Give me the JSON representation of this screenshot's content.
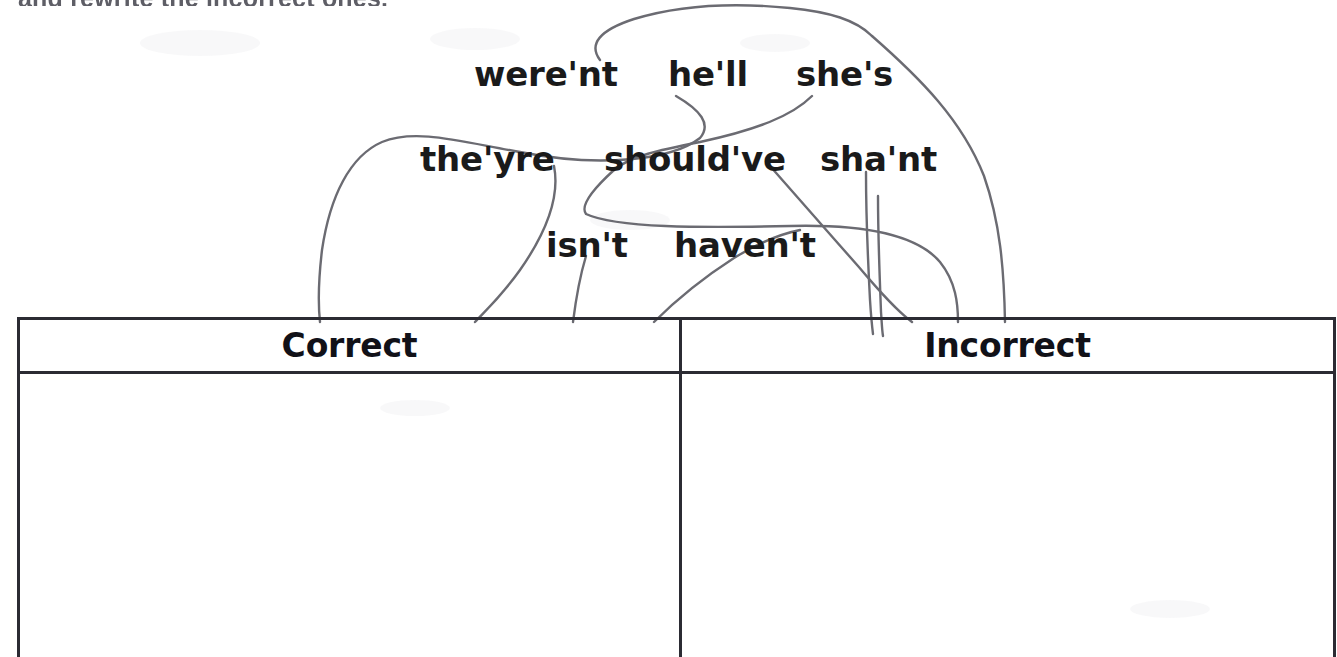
{
  "worksheet": {
    "instruction": "and rewrite the incorrect ones."
  },
  "word_bank": {
    "words": [
      {
        "text": "were'nt",
        "x": 474,
        "y": 57
      },
      {
        "text": "he'll",
        "x": 668,
        "y": 57
      },
      {
        "text": "she's",
        "x": 796,
        "y": 57
      },
      {
        "text": "the'yre",
        "x": 420,
        "y": 142
      },
      {
        "text": "should've",
        "x": 604,
        "y": 142
      },
      {
        "text": "sha'nt",
        "x": 820,
        "y": 142
      },
      {
        "text": "isn't",
        "x": 546,
        "y": 228
      },
      {
        "text": "haven't",
        "x": 674,
        "y": 228
      }
    ]
  },
  "table": {
    "columns": [
      {
        "header": "Correct",
        "cells": []
      },
      {
        "header": "Incorrect",
        "cells": []
      }
    ]
  },
  "colors": {
    "ink": "#1a1a1a",
    "rule": "#2b2b33",
    "pencil": "#6b6b72",
    "paper": "#ffffff"
  },
  "annotations": {
    "pencil_lines": [
      {
        "name": "line-werent-to-correct",
        "d": "M 600 60 C 588 44, 600 30, 634 19 C 680 5, 730 2, 790 8 C 830 12, 856 20, 872 36"
      },
      {
        "name": "line-shes-to-incorrect",
        "d": "M 872 36 C 920 78, 962 120, 984 176 C 1000 222, 1004 268, 1005 322"
      },
      {
        "name": "line-hell-loop-correct",
        "d": "M 676 96 C 700 110, 712 124, 700 138 C 672 160, 600 168, 520 152 C 462 142, 416 128, 382 142 C 350 156, 330 196, 322 250 C 318 284, 318 304, 320 322"
      },
      {
        "name": "line-shes-down-left",
        "d": "M 812 96 C 792 116, 756 130, 700 142 C 660 150, 630 156, 614 170"
      },
      {
        "name": "line-theyre-to-correct",
        "d": "M 554 166 C 560 196, 548 230, 520 270 C 500 298, 484 312, 475 322"
      },
      {
        "name": "line-under-theyre-curve",
        "d": "M 614 170 C 592 190, 580 206, 586 214 C 616 228, 700 228, 790 226 C 870 224, 918 236, 940 262 C 956 282, 958 304, 958 322"
      },
      {
        "name": "line-isnt-tick",
        "d": "M 586 256 C 580 276, 576 298, 573 322"
      },
      {
        "name": "line-havent-to-incorrect",
        "d": "M 770 166 C 796 196, 828 232, 858 266 C 880 292, 896 310, 912 322"
      },
      {
        "name": "line-shant-down",
        "d": "M 866 172 C 866 212, 868 262, 870 300 C 871 316, 872 326, 873 334"
      },
      {
        "name": "line-shant-down-2",
        "d": "M 878 196 C 878 240, 880 284, 881 312 C 882 326, 882 330, 883 336"
      },
      {
        "name": "line-havent-up-right",
        "d": "M 654 322 C 676 300, 706 276, 734 258 C 760 242, 780 234, 800 230"
      }
    ]
  }
}
